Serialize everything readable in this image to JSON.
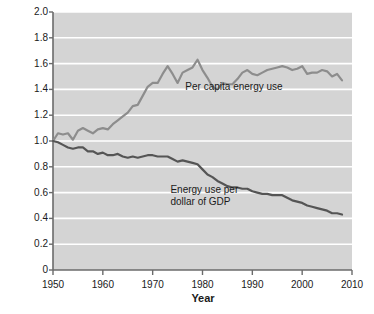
{
  "chart_data": {
    "type": "line",
    "title": "",
    "xlabel": "Year",
    "ylabel": "Value relative to 1950",
    "xlim": [
      1950,
      2010
    ],
    "ylim": [
      0,
      2.0
    ],
    "xticks": [
      1950,
      1960,
      1970,
      1980,
      1990,
      2000,
      2010
    ],
    "xtick_labels": [
      "1950",
      "1960",
      "1970",
      "1980",
      "1990",
      "2000",
      "2010"
    ],
    "yticks": [
      0,
      0.2,
      0.4,
      0.6,
      0.8,
      1.0,
      1.2,
      1.4,
      1.6,
      1.8,
      2.0
    ],
    "ytick_labels": [
      "0",
      "0.2",
      "0.4",
      "0.6",
      "0.8",
      "1.0",
      "1.2",
      "1.4",
      "1.6",
      "1.8",
      "2.0"
    ],
    "grid": true,
    "grid_color": "#ffffff",
    "plot_background": "#d4d4d4",
    "legend": "inline-annotations",
    "annotations": [
      {
        "text": "Per capita energy use",
        "x": 1988,
        "y": 1.42
      },
      {
        "text": "Energy use per\ndollar of GDP",
        "x": 1985,
        "y": 0.62
      }
    ],
    "x": [
      1950,
      1951,
      1952,
      1953,
      1954,
      1955,
      1956,
      1957,
      1958,
      1959,
      1960,
      1961,
      1962,
      1963,
      1964,
      1965,
      1966,
      1967,
      1968,
      1969,
      1970,
      1971,
      1972,
      1973,
      1974,
      1975,
      1976,
      1977,
      1978,
      1979,
      1980,
      1981,
      1982,
      1983,
      1984,
      1985,
      1986,
      1987,
      1988,
      1989,
      1990,
      1991,
      1992,
      1993,
      1994,
      1995,
      1996,
      1997,
      1998,
      1999,
      2000,
      2001,
      2002,
      2003,
      2004,
      2005,
      2006,
      2007,
      2008
    ],
    "series": [
      {
        "name": "Per capita energy use",
        "color": "#8d8d8d",
        "values": [
          1.0,
          1.06,
          1.05,
          1.06,
          1.01,
          1.08,
          1.1,
          1.08,
          1.06,
          1.09,
          1.1,
          1.09,
          1.13,
          1.16,
          1.19,
          1.22,
          1.27,
          1.28,
          1.35,
          1.42,
          1.45,
          1.45,
          1.52,
          1.58,
          1.52,
          1.45,
          1.53,
          1.55,
          1.57,
          1.63,
          1.55,
          1.49,
          1.42,
          1.4,
          1.45,
          1.44,
          1.44,
          1.48,
          1.53,
          1.55,
          1.52,
          1.51,
          1.53,
          1.55,
          1.56,
          1.57,
          1.58,
          1.57,
          1.55,
          1.56,
          1.58,
          1.52,
          1.53,
          1.53,
          1.55,
          1.54,
          1.5,
          1.52,
          1.47
        ]
      },
      {
        "name": "Energy use per dollar of GDP",
        "color": "#555555",
        "values": [
          1.0,
          0.99,
          0.97,
          0.95,
          0.94,
          0.95,
          0.95,
          0.92,
          0.92,
          0.9,
          0.91,
          0.89,
          0.89,
          0.9,
          0.88,
          0.87,
          0.88,
          0.87,
          0.88,
          0.89,
          0.89,
          0.88,
          0.88,
          0.88,
          0.86,
          0.84,
          0.85,
          0.84,
          0.83,
          0.82,
          0.78,
          0.74,
          0.72,
          0.69,
          0.67,
          0.65,
          0.64,
          0.64,
          0.63,
          0.63,
          0.61,
          0.6,
          0.59,
          0.59,
          0.58,
          0.58,
          0.58,
          0.56,
          0.54,
          0.53,
          0.52,
          0.5,
          0.49,
          0.48,
          0.47,
          0.46,
          0.44,
          0.44,
          0.43
        ]
      }
    ]
  },
  "axis": {
    "y_title": "Value relative to 1950",
    "x_title": "Year"
  },
  "labels": {
    "per_capita": "Per capita energy use",
    "per_gdp_line1": "Energy use per",
    "per_gdp_line2": "dollar of GDP"
  }
}
